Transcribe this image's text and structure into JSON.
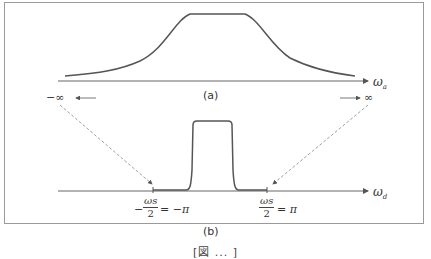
{
  "figure": {
    "panel_a": {
      "label": "(a)",
      "axis_label": "ω",
      "axis_subscript": "a",
      "curve": "bell-shaped analog frequency response"
    },
    "panel_b": {
      "label": "(b)",
      "axis_label": "ω",
      "axis_subscript": "d",
      "curve": "rectangular digital passband",
      "left_tick": {
        "prefix": "−",
        "numerator": "ωs",
        "denominator": "2",
        "suffix": "= −π"
      },
      "right_tick": {
        "numerator": "ωs",
        "denominator": "2",
        "suffix": "= π"
      }
    },
    "left_infinity": "−∞",
    "right_infinity": "∞",
    "caption": "[図 ... ]"
  },
  "colors": {
    "curve": "#555555",
    "axis": "#666666",
    "dashed": "#888888",
    "border": "#9a9a9a"
  }
}
